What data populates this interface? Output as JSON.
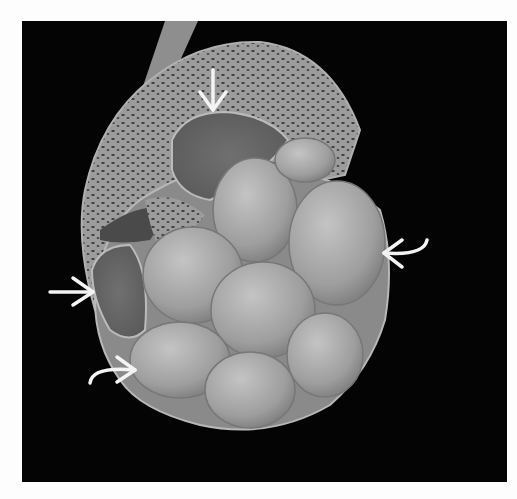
{
  "figure": {
    "background": "#040404",
    "frame_color": "#fdfdfd",
    "colors": {
      "cortex": "#9a9a9a",
      "cyst_fill": "#a8a8a8",
      "cyst_dark": "#6e6e6e",
      "arrow": "#f4f4f4",
      "ureter": "#8c8c8c"
    },
    "arrows": [
      {
        "id": "top",
        "direction": "down",
        "tip_x": 213,
        "tip_y": 112
      },
      {
        "id": "right",
        "direction": "left",
        "shape": "curved",
        "tip_x": 381,
        "tip_y": 254
      },
      {
        "id": "left",
        "direction": "right",
        "tip_x": 95,
        "tip_y": 292
      },
      {
        "id": "bottom-left",
        "direction": "right",
        "shape": "curved",
        "tip_x": 137,
        "tip_y": 370
      }
    ]
  }
}
